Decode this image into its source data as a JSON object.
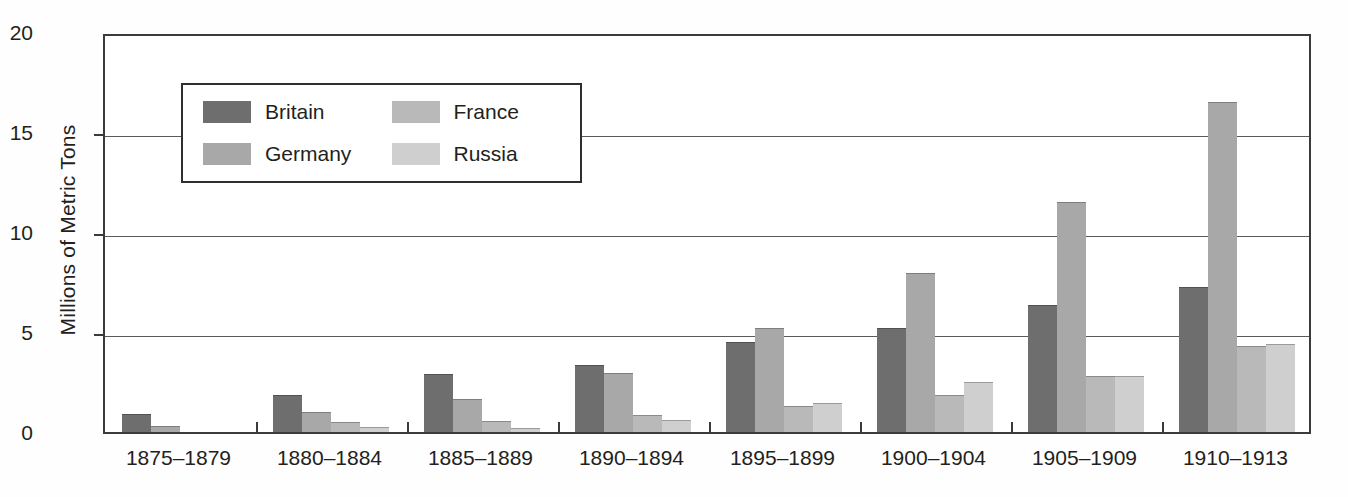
{
  "chart_data": {
    "type": "bar",
    "title": "",
    "xlabel": "",
    "ylabel": "Millions of Metric Tons",
    "ylim": [
      0,
      20
    ],
    "yticks": [
      0,
      5,
      10,
      15,
      20
    ],
    "ytick_labels": [
      "0",
      "5",
      "10",
      "15",
      "20"
    ],
    "grid": true,
    "legend_position": "upper-left-inside",
    "categories": [
      "1875–1879",
      "1880–1884",
      "1885–1889",
      "1890–1894",
      "1895–1899",
      "1900–1904",
      "1905–1909",
      "1910–1913"
    ],
    "series": [
      {
        "name": "Britain",
        "color": "#6e6e6e",
        "values": [
          0.9,
          1.85,
          2.9,
          3.35,
          4.5,
          5.2,
          6.35,
          7.25
        ]
      },
      {
        "name": "Germany",
        "color": "#a8a8a8",
        "values": [
          0.3,
          1.0,
          1.65,
          2.95,
          5.2,
          7.95,
          11.5,
          16.5
        ]
      },
      {
        "name": "France",
        "color": "#b9b9b9",
        "values": [
          0.0,
          0.5,
          0.55,
          0.85,
          1.3,
          1.85,
          2.8,
          4.3
        ]
      },
      {
        "name": "Russia",
        "color": "#cfcfcf",
        "values": [
          0.0,
          0.25,
          0.2,
          0.6,
          1.45,
          2.5,
          2.8,
          4.4
        ]
      }
    ]
  },
  "legend": {
    "items": [
      {
        "label": "Britain",
        "key": "britain"
      },
      {
        "label": "France",
        "key": "france"
      },
      {
        "label": "Germany",
        "key": "germany"
      },
      {
        "label": "Russia",
        "key": "russia"
      }
    ]
  }
}
